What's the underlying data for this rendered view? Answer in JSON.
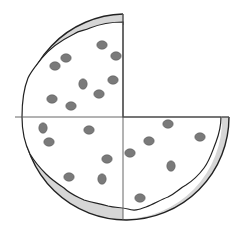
{
  "diagram": {
    "title": "Pizza cut into quarters with one quarter missing",
    "total_slices": 4,
    "remaining_slices": 3,
    "missing_slice": "top-right",
    "fraction_remaining": "3/4",
    "colors": {
      "background": "#ffffff",
      "crust": "#d6d6d6",
      "outline": "#222222",
      "cut_line": "#444444",
      "topping": "#7a7a7a",
      "topping_outline": "#5a5a5a"
    },
    "center": [
      123,
      117
    ],
    "radius": 106,
    "toppings": [
      {
        "quadrant": "top-left",
        "x": 102,
        "y": 45
      },
      {
        "quadrant": "top-left",
        "x": 116,
        "y": 56
      },
      {
        "quadrant": "top-left",
        "x": 66,
        "y": 58
      },
      {
        "quadrant": "top-left",
        "x": 55,
        "y": 66
      },
      {
        "quadrant": "top-left",
        "x": 83,
        "y": 84
      },
      {
        "quadrant": "top-left",
        "x": 113,
        "y": 80
      },
      {
        "quadrant": "top-left",
        "x": 99,
        "y": 94
      },
      {
        "quadrant": "top-left",
        "x": 52,
        "y": 99
      },
      {
        "quadrant": "top-left",
        "x": 71,
        "y": 106
      },
      {
        "quadrant": "bottom-left",
        "x": 43,
        "y": 128
      },
      {
        "quadrant": "bottom-left",
        "x": 89,
        "y": 130
      },
      {
        "quadrant": "bottom-left",
        "x": 49,
        "y": 142
      },
      {
        "quadrant": "bottom-left",
        "x": 107,
        "y": 159
      },
      {
        "quadrant": "bottom-left",
        "x": 69,
        "y": 177
      },
      {
        "quadrant": "bottom-left",
        "x": 102,
        "y": 179
      },
      {
        "quadrant": "bottom-right",
        "x": 168,
        "y": 124
      },
      {
        "quadrant": "bottom-right",
        "x": 200,
        "y": 137
      },
      {
        "quadrant": "bottom-right",
        "x": 149,
        "y": 141
      },
      {
        "quadrant": "bottom-right",
        "x": 130,
        "y": 153
      },
      {
        "quadrant": "bottom-right",
        "x": 171,
        "y": 166
      },
      {
        "quadrant": "bottom-right",
        "x": 140,
        "y": 198
      }
    ]
  }
}
